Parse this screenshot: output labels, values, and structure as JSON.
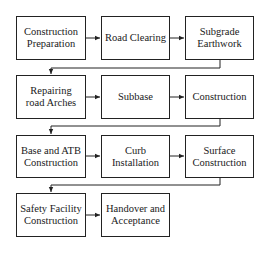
{
  "diagram": {
    "type": "flowchart",
    "layout": "3-column serpentine rows, left-to-right",
    "colors": {
      "stroke": "#222222",
      "fill": "#ffffff",
      "text": "#1a1a1a",
      "background": "#ffffff"
    },
    "steps": [
      {
        "id": "s1",
        "label": "Construction Preparation"
      },
      {
        "id": "s2",
        "label": "Road Clearing"
      },
      {
        "id": "s3",
        "label": "Subgrade Earthwork"
      },
      {
        "id": "s4",
        "label": "Repairing road Arches"
      },
      {
        "id": "s5",
        "label": "Subbase"
      },
      {
        "id": "s6",
        "label": "Construction"
      },
      {
        "id": "s7",
        "label": "Base and ATB Construction"
      },
      {
        "id": "s8",
        "label": "Curb Installation"
      },
      {
        "id": "s9",
        "label": "Surface Construction"
      },
      {
        "id": "s10",
        "label": "Safety Facility Construction"
      },
      {
        "id": "s11",
        "label": "Handover and Acceptance"
      }
    ],
    "edges": [
      [
        "s1",
        "s2"
      ],
      [
        "s2",
        "s3"
      ],
      [
        "s3",
        "s4"
      ],
      [
        "s4",
        "s5"
      ],
      [
        "s5",
        "s6"
      ],
      [
        "s6",
        "s7"
      ],
      [
        "s7",
        "s8"
      ],
      [
        "s8",
        "s9"
      ],
      [
        "s9",
        "s10"
      ],
      [
        "s10",
        "s11"
      ]
    ]
  }
}
